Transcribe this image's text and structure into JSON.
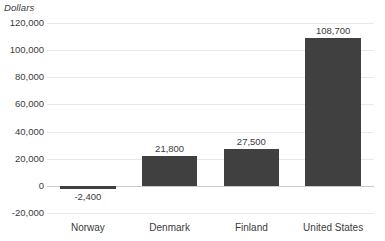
{
  "chart_data": {
    "type": "bar",
    "title": "",
    "subtitle": "",
    "xlabel": "",
    "ylabel": "Dollars",
    "categories": [
      "Norway",
      "Denmark",
      "Finland",
      "United States"
    ],
    "values": [
      -2400,
      21800,
      27500,
      108700
    ],
    "value_labels": [
      "-2,400",
      "21,800",
      "27,500",
      "108,700"
    ],
    "series": [
      {
        "name": "Dollars",
        "values": [
          -2400,
          21800,
          27500,
          108700
        ]
      }
    ],
    "ylim": [
      -20000,
      120000
    ],
    "ytick_values": [
      120000,
      100000,
      80000,
      60000,
      40000,
      20000,
      0,
      -20000
    ],
    "ytick_labels": [
      "120,000",
      "100,000",
      "80,000",
      "60,000",
      "40,000",
      "20,000",
      "0",
      "-20,000"
    ],
    "grid": true,
    "legend": "none",
    "bar_color": "#404040",
    "gridline_color": "#e8e8e8",
    "zero_line_color": "#c9c9c9",
    "text_color": "#3b3b3b",
    "background_color": "#ffffff"
  }
}
